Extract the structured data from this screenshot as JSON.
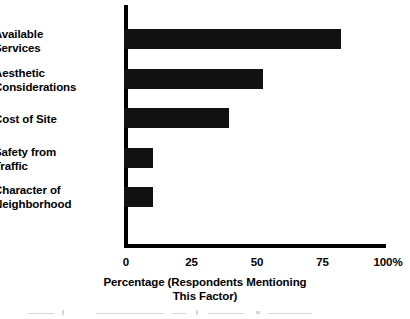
{
  "chart_data": {
    "type": "bar",
    "orientation": "horizontal",
    "title": "",
    "xlabel": "Percentage (Respondents Mentioning\nThis Factor)",
    "ylabel": "",
    "categories": [
      "Available\nServices",
      "Aesthetic\nConsiderations",
      "Cost of Site",
      "Safety from\nTraffic",
      "Character of\nNeighborhood"
    ],
    "values": [
      83,
      53,
      40,
      11,
      11
    ],
    "xlim": [
      0,
      100
    ],
    "xticks": [
      0,
      25,
      50,
      75,
      100
    ],
    "xtick_labels": [
      "0",
      "25",
      "50",
      "75",
      "100%"
    ],
    "grid": false,
    "legend": null,
    "bar_color": "#111111",
    "axis_color": "#000000",
    "background_color": "#ffffff"
  },
  "axis": {
    "title_line1": "Percentage (Respondents Mentioning",
    "title_line2": "This Factor)"
  }
}
